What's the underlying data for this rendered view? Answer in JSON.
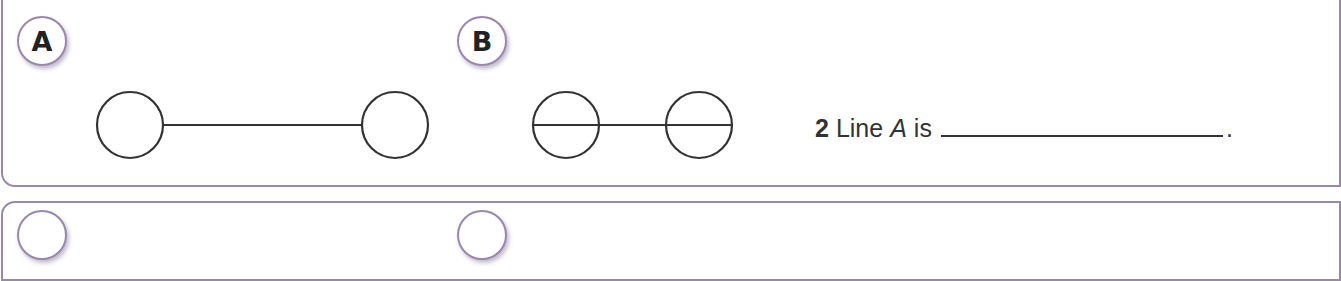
{
  "panels": [
    {
      "badge": "A",
      "diagram": {
        "type": "line-with-end-circles",
        "description": "two circles joined by a line touching their edges"
      }
    },
    {
      "badge": "B",
      "diagram": {
        "type": "line-through-circles",
        "description": "two circles with a line passing through their centers"
      }
    }
  ],
  "next_panels": [
    {
      "badge": ""
    },
    {
      "badge": ""
    }
  ],
  "question": {
    "number": "2",
    "text_before": "Line",
    "variable": "A",
    "text_after": "is",
    "blank": "",
    "end": "."
  },
  "colors": {
    "panel_border": "#9a88aa",
    "badge_border": "#9b86ad",
    "ink": "#333333"
  }
}
